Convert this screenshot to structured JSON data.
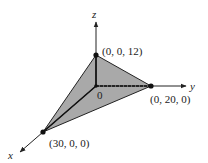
{
  "diagram": {
    "type": "3d-coordinate-plane-intercepts",
    "axes": {
      "x_label": "x",
      "y_label": "y",
      "z_label": "z",
      "origin_label": "0"
    },
    "points": [
      {
        "name": "z-intercept",
        "label": "(0, 0, 12)"
      },
      {
        "name": "y-intercept",
        "label": "(0, 20, 0)"
      },
      {
        "name": "x-intercept",
        "label": "(30, 0, 0)"
      }
    ],
    "colors": {
      "fill": "#a9a9a9",
      "line": "#111111"
    }
  }
}
